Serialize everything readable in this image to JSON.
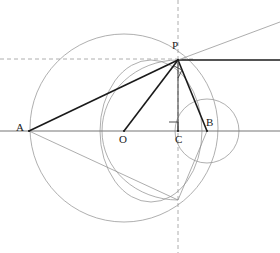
{
  "figure": {
    "canvas": {
      "width": 280,
      "height": 253
    },
    "colors": {
      "stroke_dark": "#1a1a1a",
      "stroke_thin": "#8a8a8a",
      "stroke_axis": "#777777",
      "stroke_circle": "#9a9a9a",
      "dashed": "#9a9a9a",
      "background": "#ffffff",
      "label": "#1a1a1a"
    },
    "points": [
      {
        "name": "A",
        "label": "A",
        "x": 29,
        "y": 131,
        "label_x": 16,
        "label_y": 122
      },
      {
        "name": "O",
        "label": "O",
        "x": 124,
        "y": 131,
        "label_x": 119,
        "label_y": 134
      },
      {
        "name": "C",
        "label": "C",
        "x": 178,
        "y": 131,
        "label_x": 175,
        "label_y": 134
      },
      {
        "name": "B",
        "label": "B",
        "x": 207,
        "y": 131,
        "label_x": 206,
        "label_y": 117
      },
      {
        "name": "P",
        "label": "P",
        "x": 178,
        "y": 60,
        "label_x": 172,
        "label_y": 40
      },
      {
        "name": "Q",
        "label": "",
        "x": 178,
        "y": 200,
        "label_x": 0,
        "label_y": 0
      }
    ],
    "circles": [
      {
        "name": "big-circle",
        "cx": 124,
        "cy": 128,
        "r": 94
      },
      {
        "name": "small-circle",
        "cx": 207,
        "cy": 131,
        "r": 32
      }
    ],
    "ellipses": [
      {
        "name": "inner-ellipse",
        "cx": 151,
        "cy": 131,
        "rx": 51,
        "ry": 71
      }
    ],
    "arcs": [
      {
        "name": "arc-through-P-and-Q",
        "d": "M 102 131 A 76 71 0 0 1 178 60"
      },
      {
        "name": "arc-lower-left",
        "d": "M 102 131 A 76 69 0 0 0 178 200"
      }
    ],
    "segments": [
      {
        "name": "axis-line",
        "x1": 0,
        "y1": 131,
        "x2": 280,
        "y2": 131,
        "weight": "axis"
      },
      {
        "name": "segment-AP",
        "x1": 29,
        "y1": 131,
        "x2": 178,
        "y2": 60,
        "weight": "thick"
      },
      {
        "name": "segment-OP",
        "x1": 124,
        "y1": 131,
        "x2": 178,
        "y2": 60,
        "weight": "thick"
      },
      {
        "name": "segment-PB",
        "x1": 178,
        "y1": 60,
        "x2": 207,
        "y2": 131,
        "weight": "thick"
      },
      {
        "name": "segment-PC",
        "x1": 178,
        "y1": 60,
        "x2": 178,
        "y2": 131,
        "weight": "medium"
      },
      {
        "name": "tangent-right",
        "x1": 178,
        "y1": 60,
        "x2": 280,
        "y2": 60,
        "weight": "thick"
      },
      {
        "name": "ray-P-upper-right",
        "x1": 178,
        "y1": 60,
        "x2": 280,
        "y2": 22,
        "weight": "thin"
      },
      {
        "name": "segment-A-Q",
        "x1": 29,
        "y1": 131,
        "x2": 178,
        "y2": 200,
        "weight": "thin"
      },
      {
        "name": "segment-Q-B",
        "x1": 178,
        "y1": 200,
        "x2": 207,
        "y2": 131,
        "weight": "thin"
      }
    ],
    "dashed_lines": [
      {
        "name": "dashed-horizontal",
        "x1": 0,
        "y1": 59,
        "x2": 196,
        "y2": 59
      },
      {
        "name": "dashed-vertical",
        "x1": 178,
        "y1": 0,
        "x2": 178,
        "y2": 253
      }
    ],
    "right_angle_marks": [
      {
        "name": "right-angle-at-C",
        "d": "M 169 122 L 178 122 L 178 131"
      },
      {
        "name": "right-angle-at-P",
        "d": "M 174 66 L 182 70 L 178 78"
      }
    ]
  }
}
